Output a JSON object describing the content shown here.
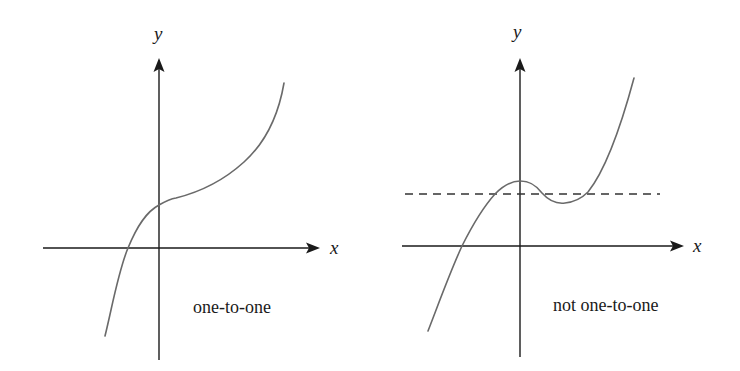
{
  "panels": [
    {
      "id": "left",
      "caption": "one-to-one",
      "x_axis_label": "x",
      "y_axis_label": "y",
      "curve_description": "monotonically increasing cubic-like curve",
      "horizontal_test_line": false
    },
    {
      "id": "right",
      "caption": "not one-to-one",
      "x_axis_label": "x",
      "y_axis_label": "y",
      "curve_description": "cubic curve with local max near y-axis and local min to the right",
      "horizontal_test_line": true,
      "horizontal_test_line_style": "dashed",
      "horizontal_test_line_intersections": 3
    }
  ],
  "colors": {
    "axes": "#1a1a1a",
    "curve": "#6a6a6a",
    "dashed_line": "#333333",
    "background": "#ffffff"
  }
}
